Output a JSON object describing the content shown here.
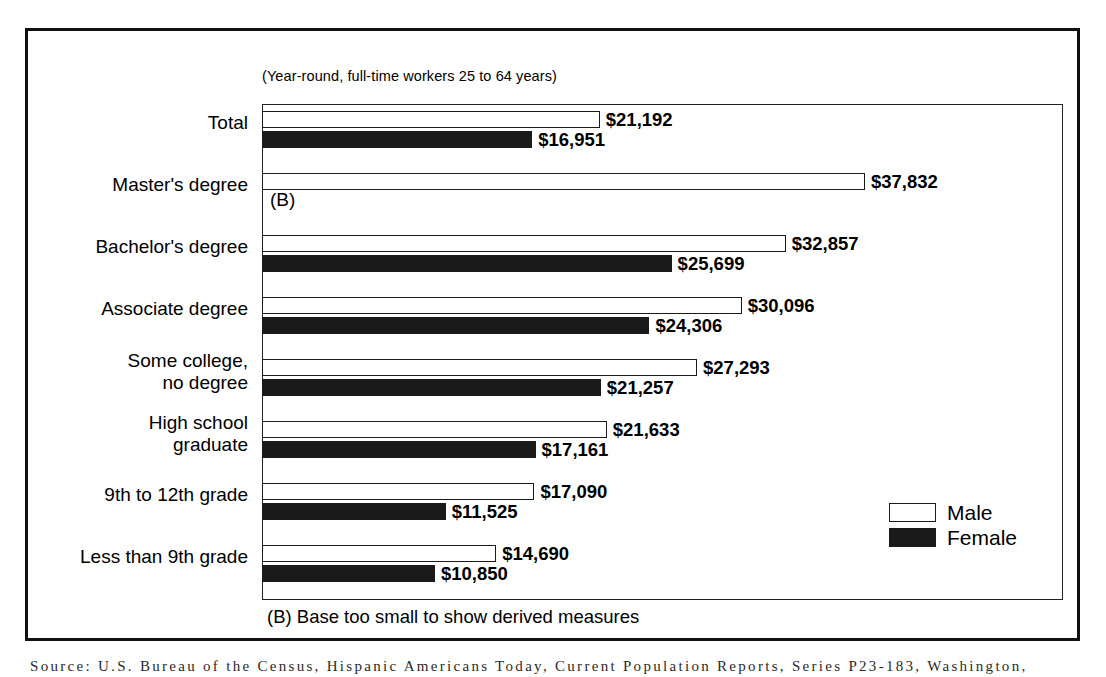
{
  "subtitle": "(Year-round, full-time workers 25 to 64 years)",
  "footnote": "(B) Base too small to show derived measures",
  "source": "Source:  U.S. Bureau of the Census, Hispanic Americans Today, Current Population Reports, Series P23-183, Washington,",
  "legend": {
    "items": [
      {
        "key": "male",
        "label": "Male",
        "color": "#ffffff"
      },
      {
        "key": "female",
        "label": "Female",
        "color": "#1a1a1a"
      }
    ]
  },
  "suppressed_marker": "(B)",
  "chart_data": {
    "type": "bar",
    "orientation": "horizontal",
    "title": "",
    "subtitle": "(Year-round, full-time workers 25 to 64 years)",
    "xlabel": "",
    "ylabel": "",
    "xlim": [
      0,
      37832
    ],
    "grid": false,
    "legend_position": "bottom-right",
    "categories": [
      "Total",
      "Master's degree",
      "Bachelor's degree",
      "Associate degree",
      "Some college,\nno degree",
      "High school\ngraduate",
      "9th to 12th grade",
      "Less than 9th grade"
    ],
    "series": [
      {
        "name": "Male",
        "values": [
          21192,
          37832,
          32857,
          30096,
          27293,
          21633,
          17090,
          14690
        ],
        "labels": [
          "$21,192",
          "$37,832",
          "$32,857",
          "$30,096",
          "$27,293",
          "$21,633",
          "$17,090",
          "$14,690"
        ]
      },
      {
        "name": "Female",
        "values": [
          16951,
          null,
          25699,
          24306,
          21257,
          17161,
          11525,
          10850
        ],
        "labels": [
          "$16,951",
          "(B)",
          "$25,699",
          "$24,306",
          "$21,257",
          "$17,161",
          "$11,525",
          "$10,850"
        ]
      }
    ],
    "notes": [
      "(B) Base too small to show derived measures"
    ]
  }
}
